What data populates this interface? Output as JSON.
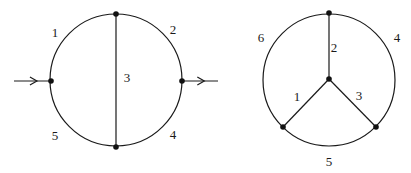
{
  "diagrams": [
    {
      "name": "left-diagram",
      "circle": {
        "cx": 116,
        "cy": 80,
        "r": 66
      },
      "vertices": [
        {
          "id": "top",
          "x": 116,
          "y": 14
        },
        {
          "id": "bottom",
          "x": 116,
          "y": 147
        },
        {
          "id": "left",
          "x": 51,
          "y": 81
        },
        {
          "id": "right",
          "x": 182,
          "y": 81
        }
      ],
      "chord": {
        "x1": 116,
        "y1": 14,
        "x2": 116,
        "y2": 147
      },
      "arrows": [
        {
          "name": "incoming-arrow",
          "x1": 14,
          "y1": 81,
          "x2": 51,
          "y2": 81
        },
        {
          "name": "outgoing-arrow",
          "x1": 182,
          "y1": 81,
          "x2": 218,
          "y2": 81
        }
      ],
      "labels": [
        {
          "text": "1",
          "x": 55,
          "y": 37
        },
        {
          "text": "2",
          "x": 173,
          "y": 34
        },
        {
          "text": "3",
          "x": 127,
          "y": 82
        },
        {
          "text": "4",
          "x": 173,
          "y": 139
        },
        {
          "text": "5",
          "x": 55,
          "y": 140
        }
      ]
    },
    {
      "name": "right-diagram",
      "circle": {
        "cx": 329,
        "cy": 80,
        "r": 66
      },
      "vertices": [
        {
          "id": "top",
          "x": 329,
          "y": 13
        },
        {
          "id": "center",
          "x": 329,
          "y": 79
        },
        {
          "id": "bottom-left",
          "x": 283,
          "y": 127
        },
        {
          "id": "bottom-right",
          "x": 376,
          "y": 127
        }
      ],
      "spokes": [
        {
          "x1": 329,
          "y1": 79,
          "x2": 329,
          "y2": 13
        },
        {
          "x1": 329,
          "y1": 79,
          "x2": 283,
          "y2": 127
        },
        {
          "x1": 329,
          "y1": 79,
          "x2": 376,
          "y2": 127
        }
      ],
      "labels": [
        {
          "text": "6",
          "x": 261,
          "y": 42
        },
        {
          "text": "2",
          "x": 334,
          "y": 52
        },
        {
          "text": "4",
          "x": 397,
          "y": 42
        },
        {
          "text": "1",
          "x": 297,
          "y": 101
        },
        {
          "text": "3",
          "x": 359,
          "y": 100
        },
        {
          "text": "5",
          "x": 329,
          "y": 166
        }
      ]
    }
  ]
}
